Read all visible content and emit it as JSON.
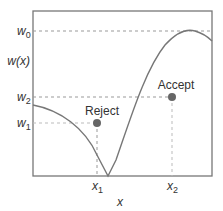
{
  "diagram": {
    "y_axis_label": "w(x)",
    "x_axis_label": "x",
    "y_ticks": [
      {
        "name": "w",
        "sub": "0"
      },
      {
        "name": "w",
        "sub": "2"
      },
      {
        "name": "w",
        "sub": "1"
      }
    ],
    "x_ticks": [
      {
        "name": "x",
        "sub": "1"
      },
      {
        "name": "x",
        "sub": "2"
      }
    ],
    "points": [
      {
        "label": "Reject"
      },
      {
        "label": "Accept"
      }
    ],
    "colors": {
      "curve": "#777777",
      "axis": "#777777",
      "dashed": "#999999",
      "point": "#666666",
      "text": "#333333"
    }
  }
}
